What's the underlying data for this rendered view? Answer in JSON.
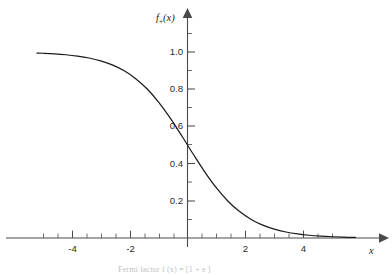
{
  "chart_data": {
    "type": "line",
    "title": "",
    "xlabel": "x",
    "ylabel": "f+(x)",
    "ylabel_base": "f",
    "ylabel_subscript": "+",
    "ylabel_arg": "(x)",
    "xlim": [
      -5.6,
      6.2
    ],
    "ylim": [
      -0.06,
      1.12
    ],
    "grid": false,
    "legend": null,
    "x_ticks_major": [
      -4,
      -2,
      2,
      4
    ],
    "x_tick_labels": [
      "-4",
      "-2",
      "2",
      "4"
    ],
    "x_ticks_minor": [
      -5,
      -4.5,
      -3.5,
      -3,
      -2.5,
      -1.5,
      -1,
      -0.5,
      0.5,
      1,
      1.5,
      2.5,
      3,
      3.5,
      4.5,
      5
    ],
    "y_ticks_major": [
      0.2,
      0.4,
      0.6,
      0.8,
      1.0
    ],
    "y_tick_labels": [
      "0.2",
      "0.4",
      "0.6",
      "0.8",
      "1.0"
    ],
    "y_ticks_minor": [
      0.1,
      0.3,
      0.5,
      0.7,
      0.9,
      1.1
    ],
    "series": [
      {
        "name": "f+(x)",
        "equation": "1/(1+exp(x))",
        "x": [
          -5.2,
          -5.0,
          -4.6,
          -4.2,
          -3.8,
          -3.4,
          -3.0,
          -2.6,
          -2.2,
          -1.8,
          -1.4,
          -1.0,
          -0.6,
          -0.2,
          0.0,
          0.2,
          0.6,
          1.0,
          1.4,
          1.8,
          2.2,
          2.6,
          3.0,
          3.4,
          3.8,
          4.2,
          4.6,
          5.0,
          5.4,
          5.8
        ],
        "y": [
          0.9945,
          0.9933,
          0.99,
          0.9852,
          0.978,
          0.9677,
          0.9526,
          0.9309,
          0.9002,
          0.8581,
          0.8022,
          0.7311,
          0.6457,
          0.5498,
          0.5,
          0.4502,
          0.3543,
          0.2689,
          0.1978,
          0.1419,
          0.0998,
          0.0691,
          0.0474,
          0.0323,
          0.0219,
          0.0148,
          0.01,
          0.0067,
          0.0045,
          0.003
        ]
      }
    ],
    "annotations": [],
    "line_color": "#1b1b1b",
    "axis_color": "#4a4a4a",
    "background_color": "#ffffff"
  },
  "figure": {
    "caption": "Fermi factor f (x) = [1 + e  ]",
    "y_axis_arrow": "arrow-up",
    "x_axis_arrow": "arrow-right"
  }
}
